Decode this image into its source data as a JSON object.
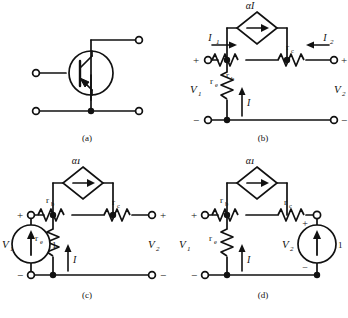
{
  "figure": {
    "stroke_color": "#111111",
    "background": "#ffffff"
  },
  "panels": [
    {
      "id": "a",
      "caption": "(a)",
      "type": "transistor-symbol",
      "device": "pnp-bipolar-transistor",
      "terminals": [
        "base-terminal",
        "collector-terminal",
        "emitter-terminal-left",
        "emitter-terminal-right"
      ],
      "labels": []
    },
    {
      "id": "b",
      "caption": "(b)",
      "type": "two-port-equivalent-circuit",
      "labels": {
        "source": "αI",
        "rb": "r",
        "rb_sub": "b",
        "rc": "r",
        "rc_sub": "c",
        "re": "r",
        "re_sub": "e",
        "i1": "I",
        "i1_sub": "1",
        "i2": "I",
        "i2_sub": "2",
        "i": "I",
        "v1": "V",
        "v1_sub": "1",
        "v2": "V",
        "v2_sub": "2",
        "plus_left": "+",
        "minus_left": "−",
        "plus_right": "+",
        "minus_right": "−"
      }
    },
    {
      "id": "c",
      "caption": "(c)",
      "type": "driven-port-1-circuit",
      "labels": {
        "source": "αI",
        "rb": "r",
        "rb_sub": "b",
        "rc": "r",
        "rc_sub": "c",
        "re": "r",
        "re_sub": "e",
        "i": "I",
        "v1": "V",
        "v1_sub": "1",
        "v2": "V",
        "v2_sub": "2",
        "source_value": "1",
        "plus_left": "+",
        "minus_left": "−",
        "plus_right": "+",
        "minus_right": "−"
      }
    },
    {
      "id": "d",
      "caption": "(d)",
      "type": "driven-port-2-circuit",
      "labels": {
        "source": "αI",
        "rb": "r",
        "rb_sub": "b",
        "rc": "r",
        "rc_sub": "c",
        "re": "r",
        "re_sub": "e",
        "i": "I",
        "v1": "V",
        "v1_sub": "1",
        "v2": "V",
        "v2_sub": "2",
        "source_value": "1",
        "plus_left": "+",
        "minus_left": "−",
        "plus_source": "+",
        "minus_source": "−"
      }
    }
  ]
}
